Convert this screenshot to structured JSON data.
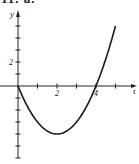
{
  "header": {
    "problem_label": "11. a."
  },
  "chart_data": {
    "type": "line",
    "title": "",
    "xlabel": "t",
    "ylabel": "y",
    "function": "y = t^2 - 4t",
    "x": [
      0,
      0.5,
      1,
      1.5,
      2,
      2.5,
      3,
      3.5,
      4,
      4.5,
      5
    ],
    "series": [
      {
        "name": "curve",
        "values": [
          0,
          -1.75,
          -3,
          -3.75,
          -4,
          -3.75,
          -3,
          -1.75,
          0,
          2.25,
          5
        ]
      }
    ],
    "x_tick_values": [
      0,
      1,
      2,
      3,
      4,
      5
    ],
    "x_tick_labels": {
      "2": "2",
      "4": "4"
    },
    "y_tick_values": [
      -6,
      -5,
      -4,
      -3,
      -2,
      -1,
      0,
      1,
      2,
      3,
      4,
      5
    ],
    "y_tick_labels": {
      "2": "2"
    },
    "xlim": [
      0,
      6
    ],
    "ylim": [
      -6,
      6
    ],
    "grid": false,
    "legend": "none"
  },
  "colors": {
    "axis": "#222222",
    "curve": "#1a1a1a"
  }
}
